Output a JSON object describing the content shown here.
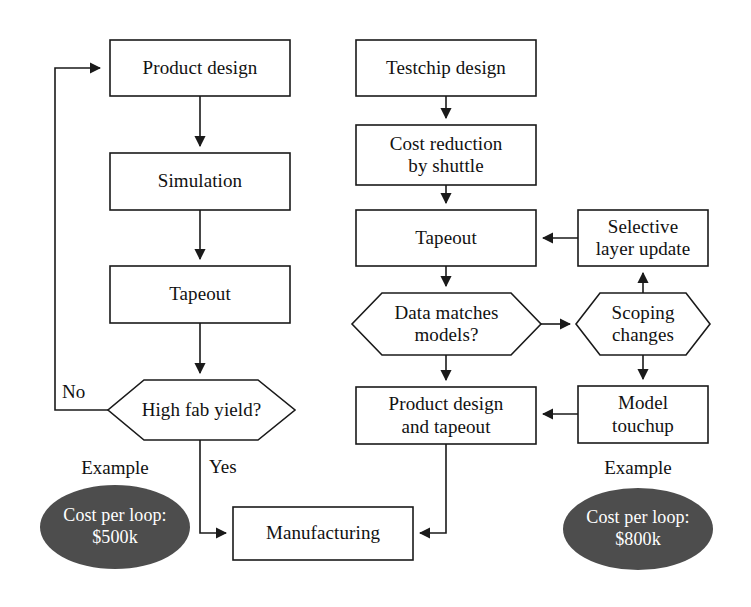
{
  "diagram": {
    "background_color": "#ffffff",
    "line_color": "#1a1a1a",
    "ellipse_fill": "#4d4d4d",
    "ellipse_text_color": "#ffffff",
    "text_color": "#111111"
  },
  "left_flow": {
    "nodes": [
      {
        "id": "product-design",
        "label": "Product design",
        "shape": "rect"
      },
      {
        "id": "simulation",
        "label": "Simulation",
        "shape": "rect"
      },
      {
        "id": "tapeout",
        "label": "Tapeout",
        "shape": "rect"
      },
      {
        "id": "high-fab-yield",
        "label": "High fab yield?",
        "shape": "hexagon"
      }
    ],
    "edge_labels": {
      "no": "No",
      "yes": "Yes"
    },
    "example": {
      "caption": "Example",
      "cost_line1": "Cost per loop:",
      "cost_line2": "$500k"
    }
  },
  "right_flow": {
    "nodes": [
      {
        "id": "testchip-design",
        "label": "Testchip design",
        "shape": "rect"
      },
      {
        "id": "cost-reduction",
        "label": "Cost reduction\nby shuttle",
        "shape": "rect"
      },
      {
        "id": "tapeout-2",
        "label": "Tapeout",
        "shape": "rect"
      },
      {
        "id": "data-matches-models",
        "label": "Data matches\nmodels?",
        "shape": "hexagon"
      },
      {
        "id": "product-design-and-tapeout",
        "label": "Product design\nand tapeout",
        "shape": "rect"
      },
      {
        "id": "selective-layer-update",
        "label": "Selective\nlayer update",
        "shape": "rect"
      },
      {
        "id": "scoping-changes",
        "label": "Scoping\nchanges",
        "shape": "hexagon"
      },
      {
        "id": "model-touchup",
        "label": "Model\ntouchup",
        "shape": "rect"
      }
    ],
    "example": {
      "caption": "Example",
      "cost_line1": "Cost per loop:",
      "cost_line2": "$800k"
    }
  },
  "shared": {
    "manufacturing": {
      "id": "manufacturing",
      "label": "Manufacturing",
      "shape": "rect"
    }
  }
}
